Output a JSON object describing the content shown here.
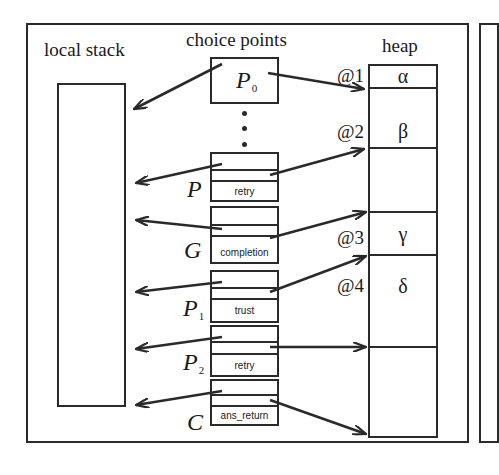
{
  "diagram": {
    "sections": {
      "local_stack": "local stack",
      "choice_points": "choice points",
      "heap": "heap"
    },
    "choice_points": [
      {
        "id": "p0",
        "label": "P",
        "subscript": "0",
        "field": ""
      },
      {
        "id": "p",
        "label": "P",
        "subscript": "",
        "field": "retry"
      },
      {
        "id": "g",
        "label": "G",
        "subscript": "",
        "field": "completion"
      },
      {
        "id": "p1",
        "label": "P",
        "subscript": "1",
        "field": "trust"
      },
      {
        "id": "p2",
        "label": "P",
        "subscript": "2",
        "field": "retry"
      },
      {
        "id": "c",
        "label": "C",
        "subscript": "",
        "field": "ans_return"
      }
    ],
    "heap_addresses": [
      "@1",
      "@2",
      "@3",
      "@4"
    ],
    "heap_cells": [
      "α",
      "β",
      "",
      "γ",
      "δ",
      ""
    ],
    "colors": {
      "line": "#2a2a2a",
      "background": "#ffffff"
    }
  }
}
